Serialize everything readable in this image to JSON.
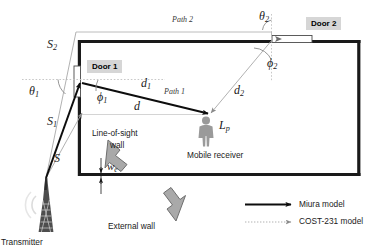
{
  "figure": {
    "type": "diagram"
  },
  "labels": {
    "transmitter": "Transmitter",
    "door1": "Door 1",
    "door2": "Door 2",
    "path1": "Path 1",
    "path2": "Path 2",
    "mobile_receiver": "Mobile receiver",
    "line_of_sight_wall_line1": "Line-of-sight",
    "line_of_sight_wall_line2": "wall",
    "external_wall": "External wall"
  },
  "symbols": {
    "S": "S",
    "S1_base": "S",
    "S1_sub": "1",
    "S2_base": "S",
    "S2_sub": "2",
    "theta1_base": "θ",
    "theta1_sub": "1",
    "theta2_base": "θ",
    "theta2_sub": "2",
    "phi1_base": "ϕ",
    "phi1_sub": "1",
    "phi2_base": "ϕ",
    "phi2_sub": "2",
    "d": "d",
    "d1_base": "d",
    "d1_sub": "1",
    "d2_base": "d",
    "d2_sub": "2",
    "we_base": "w",
    "we_sub": "e",
    "Lp_base": "L",
    "Lp_sub": "p"
  },
  "legend": {
    "items": [
      {
        "label": "Miura model",
        "style": "solid-black-arrow",
        "color": "#0d0d0d"
      },
      {
        "label": "COST-231 model",
        "style": "dotted-gray-arrow",
        "color": "#a0a0a0"
      }
    ]
  },
  "colors": {
    "wall": "#1a1a1a",
    "miura": "#0d0d0d",
    "cost231": "#a8a8a8",
    "door_label_bg": "#d6d6d6",
    "block_arrow_fill": "#a9a9a9",
    "block_arrow_stroke": "#6e6e6e",
    "person": "#9a9a9a",
    "guide_line": "#c9c9c9",
    "background": "#ffffff"
  },
  "geometry": {
    "room": {
      "x": 78,
      "y": 40,
      "width": 282,
      "height": 135
    },
    "transmitter_apex": {
      "x": 46,
      "y": 178
    },
    "door1": {
      "x": 78,
      "y": 66,
      "height": 31
    },
    "door2": {
      "x": 272,
      "y": 40,
      "width": 38
    },
    "receiver": {
      "x": 206,
      "y": 117
    }
  }
}
